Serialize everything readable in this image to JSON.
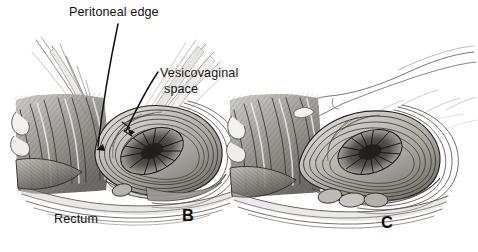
{
  "figure": {
    "kind": "medical-illustration",
    "style": "pen-and-ink stipple/hatch anatomical drawing",
    "background_color": "#ffffff",
    "ink_color": "#15130f",
    "width": 478,
    "height": 252
  },
  "labels": {
    "peritoneal_edge": "Peritoneal edge",
    "vesicovaginal_line1": "Vesicovaginal",
    "vesicovaginal_line2": "space",
    "rectum": "Rectum"
  },
  "panels": [
    {
      "letter": "B",
      "position": "left"
    },
    {
      "letter": "C",
      "position": "right"
    }
  ],
  "panel_letters": {
    "b": "B",
    "c": "C"
  },
  "leader_lines": [
    {
      "label": "peritoneal_edge",
      "from": [
        118,
        24
      ],
      "to": [
        98,
        148
      ]
    },
    {
      "label": "vesicovaginal_space",
      "from": [
        158,
        72
      ],
      "to": [
        126,
        131
      ]
    }
  ]
}
